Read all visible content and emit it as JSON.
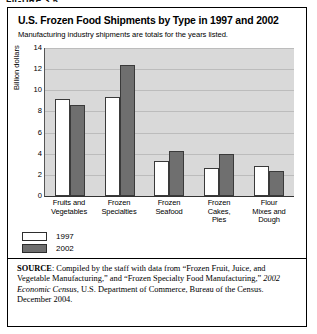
{
  "figure_tag": "FIGURE 3.5",
  "header": {
    "title": "U.S. Frozen Food Shipments by Type in 1997 and 2002",
    "subtitle": "Manufacturing industry shipments are totals for the years listed."
  },
  "chart_data": {
    "type": "bar",
    "title": "U.S. Frozen Food Shipments by Type in 1997 and 2002",
    "subtitle": "Manufacturing industry shipments are totals for the years listed.",
    "xlabel": "",
    "ylabel": "Billion dollars",
    "ylim": [
      0,
      14
    ],
    "yticks": [
      0,
      2,
      4,
      6,
      8,
      10,
      12,
      14
    ],
    "grid": true,
    "legend_position": "below-left",
    "categories": [
      "Fruits and Vegetables",
      "Frozen Specialties",
      "Frozen Seafood",
      "Frozen Cakes, Pies",
      "Flour Mixes and Dough"
    ],
    "series": [
      {
        "name": "1997",
        "color": "#ffffff",
        "values": [
          9.2,
          9.4,
          3.3,
          2.65,
          2.8
        ]
      },
      {
        "name": "2002",
        "color": "#6f6f6f",
        "values": [
          8.6,
          12.4,
          4.25,
          3.95,
          2.4
        ]
      }
    ]
  },
  "source": {
    "label": "SOURCE",
    "text_part1": ": Compiled by the staff with data from “Frozen Fruit, Juice, and Vegetable Manufacturing,” and “Frozen Specialty Food Manufacturing,” ",
    "italic": "2002 Economic Census",
    "text_part2": ", U.S. Department of Commerce, Bureau of the Census. December 2004."
  }
}
